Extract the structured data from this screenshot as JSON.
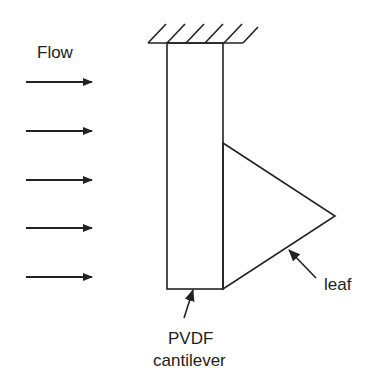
{
  "labels": {
    "flow": "Flow",
    "leaf": "leaf",
    "cantilever_line1": "PVDF",
    "cantilever_line2": "cantilever"
  },
  "colors": {
    "stroke": "#222222",
    "background": "#ffffff"
  },
  "flow_arrows": [
    {
      "y": 82
    },
    {
      "y": 131
    },
    {
      "y": 180
    },
    {
      "y": 228
    },
    {
      "y": 277
    }
  ]
}
